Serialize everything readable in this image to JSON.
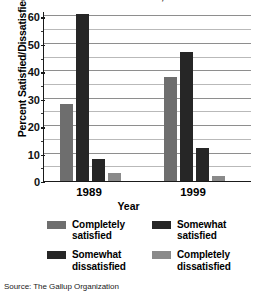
{
  "chart_data": {
    "type": "bar",
    "title": "Percent Satisfied/Dissatisfied, 1989 vs. 1999",
    "xlabel": "Year",
    "ylabel": "Percent Satisfied/Dissatisfied",
    "categories": [
      "1989",
      "1999"
    ],
    "series": [
      {
        "name": "Completely satisfied",
        "values": [
          28,
          38
        ],
        "color": "#6e6e6e"
      },
      {
        "name": "Somewhat satisfied",
        "values": [
          61,
          47
        ],
        "color": "#262626"
      },
      {
        "name": "Somewhat dissatisfied",
        "values": [
          8,
          12
        ],
        "color": "#262626"
      },
      {
        "name": "Completely dissatisfied",
        "values": [
          3,
          2
        ],
        "color": "#8a8a8a"
      }
    ],
    "ylim": [
      0,
      62
    ],
    "yticks": [
      0,
      10,
      20,
      30,
      40,
      50,
      60
    ],
    "ytick_labels": [
      "0",
      "10",
      "20",
      "30",
      "40",
      "50",
      "60"
    ],
    "minor_yticks": [
      5,
      15,
      25,
      35,
      45,
      55
    ],
    "grid": true,
    "legend_position": "below"
  },
  "source": "Source: The Gallup Organization"
}
